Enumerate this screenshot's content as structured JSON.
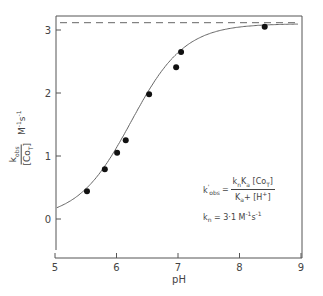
{
  "chart_data": {
    "type": "scatter",
    "title": "",
    "xlabel": "pH",
    "ylabel": "k_obs / [Co_T]  M^-1 s^-1",
    "xlim": [
      5,
      9
    ],
    "ylim": [
      -0.5,
      3.2
    ],
    "xticks": [
      5,
      6,
      7,
      8,
      9
    ],
    "yticks": [
      0,
      1,
      2,
      3
    ],
    "grid": false,
    "series": [
      {
        "name": "observed",
        "type": "scatter",
        "x": [
          5.52,
          5.81,
          6.01,
          6.15,
          6.53,
          6.97,
          7.05,
          8.41
        ],
        "y": [
          0.44,
          0.79,
          1.05,
          1.25,
          1.98,
          2.41,
          2.65,
          3.05
        ]
      },
      {
        "name": "fit",
        "type": "line",
        "equation": "k'_obs = k_n Ka [Co_T] / (Ka + [H+])",
        "params": {
          "k_n": 3.1,
          "pKa": 6.24
        }
      },
      {
        "name": "limit",
        "type": "line",
        "style": "dashed",
        "y": 3.1
      }
    ],
    "annotations": [
      "k'obs = kn Ka [CoT] / (Ka + [H+])",
      "kn = 3.1 M^-1 s^-1"
    ]
  },
  "labels": {
    "xlabel": "pH",
    "y_num": "k",
    "y_num_sub": "obs",
    "y_den_open": "[Co",
    "y_den_sub": "T",
    "y_den_close": "]",
    "y_units": "M",
    "y_units_sup1": "-1",
    "y_units_s": "s",
    "y_units_sup2": "-1",
    "eq_lhs": "k",
    "eq_lhs_sup": "'",
    "eq_lhs_sub": "obs",
    "eq_eq": "=",
    "eq_num": "k",
    "eq_num_sub1": "n",
    "eq_num_mid": "K",
    "eq_num_sub2": "a",
    "eq_num_tail": " [Co",
    "eq_num_sub3": "T",
    "eq_num_end": "]",
    "eq_den": "K",
    "eq_den_sub": "a",
    "eq_den_tail": "+ [H",
    "eq_den_sup": "+",
    "eq_den_end": "]",
    "kn_text": "k",
    "kn_sub": "n",
    "kn_val": "= 3·1  M",
    "kn_sup1": "-1",
    "kn_s": "s",
    "kn_sup2": "-1"
  },
  "ticks": {
    "x": [
      "5",
      "6",
      "7",
      "8",
      "9"
    ],
    "y": [
      "0",
      "1",
      "2",
      "3"
    ]
  }
}
